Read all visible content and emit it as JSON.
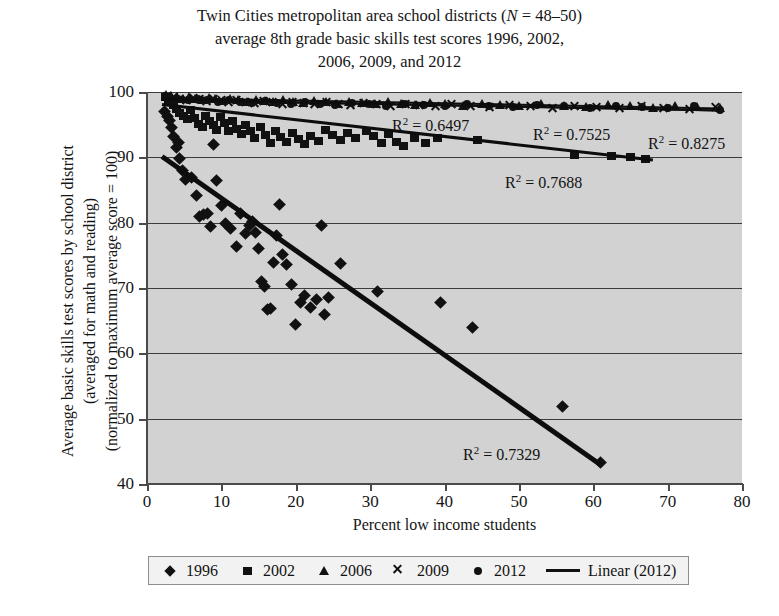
{
  "title": {
    "line1_pre": "Twin Cities metropolitan area school districts (",
    "line1_italic": "N",
    "line1_post": " = 48–50)",
    "line2": "average 8th grade basic skills test scores 1996, 2002,",
    "line3": "2006, 2009, and 2012"
  },
  "legend": {
    "items": [
      {
        "label": "1996",
        "marker": "diamond-marker"
      },
      {
        "label": "2002",
        "marker": "square-marker"
      },
      {
        "label": "2006",
        "marker": "triangle-marker"
      },
      {
        "label": "2009",
        "marker": "x-marker"
      },
      {
        "label": "2012",
        "marker": "circle-marker"
      },
      {
        "label": "Linear (2012)",
        "marker": "line-marker"
      }
    ]
  },
  "annotations": [
    {
      "text": "R² = 0.6497",
      "x": 392,
      "y": 115
    },
    {
      "text": "R² = 0.7525",
      "x": 533,
      "y": 124
    },
    {
      "text": "R² = 0.8275",
      "x": 648,
      "y": 133
    },
    {
      "text": "R² = 0.7688",
      "x": 505,
      "y": 172
    },
    {
      "text": "R² = 0.7329",
      "x": 463,
      "y": 444
    }
  ],
  "colors": {
    "plot_background": "#d2d2d2",
    "marker": "#111111",
    "gridline": "#3c3c3c",
    "axis": "#4a4a4a",
    "legend_background": "#f2f2f2"
  },
  "chart_data": {
    "type": "scatter",
    "title": "Twin Cities metropolitan area school districts (N = 48–50) average 8th grade basic skills test scores 1996, 2002, 2006, 2009, and 2012",
    "xlabel": "Percent low income students",
    "ylabel": "Average basic skills test scores by school district (averaged for math and reading) (normalized to maximum average score = 100)",
    "xlim": [
      0,
      80
    ],
    "ylim": [
      40,
      100
    ],
    "xticks": [
      0,
      10,
      20,
      30,
      40,
      50,
      60,
      70,
      80
    ],
    "yticks": [
      40,
      50,
      60,
      70,
      80,
      90,
      100
    ],
    "grid": "horizontal",
    "legend_position": "bottom",
    "series": [
      {
        "name": "1996",
        "marker": "diamond",
        "r_squared": 0.7329,
        "trendline": {
          "x0": 2.0,
          "y0": 90.5,
          "x1": 61.0,
          "y1": 43.3
        },
        "points": [
          [
            2.4,
            97.0
          ],
          [
            2.7,
            96.2
          ],
          [
            3.0,
            95.6
          ],
          [
            3.3,
            94.5
          ],
          [
            3.6,
            93.2
          ],
          [
            4.0,
            91.5
          ],
          [
            4.4,
            89.8
          ],
          [
            4.8,
            88.0
          ],
          [
            5.2,
            86.6
          ],
          [
            4.2,
            92.3
          ],
          [
            6.0,
            86.9
          ],
          [
            6.6,
            84.1
          ],
          [
            7.0,
            81.0
          ],
          [
            7.6,
            81.2
          ],
          [
            8.2,
            81.4
          ],
          [
            8.6,
            79.4
          ],
          [
            9.0,
            92.0
          ],
          [
            9.4,
            86.5
          ],
          [
            10.0,
            82.7
          ],
          [
            10.6,
            79.9
          ],
          [
            11.2,
            79.1
          ],
          [
            12.0,
            76.3
          ],
          [
            12.6,
            81.4
          ],
          [
            13.2,
            78.4
          ],
          [
            13.8,
            79.6
          ],
          [
            14.2,
            80.2
          ],
          [
            14.6,
            78.5
          ],
          [
            15.0,
            76.0
          ],
          [
            15.4,
            71.0
          ],
          [
            15.8,
            70.2
          ],
          [
            16.2,
            66.7
          ],
          [
            16.6,
            66.8
          ],
          [
            17.0,
            73.9
          ],
          [
            17.4,
            78.1
          ],
          [
            17.8,
            82.8
          ],
          [
            18.2,
            75.2
          ],
          [
            18.8,
            73.6
          ],
          [
            19.4,
            70.6
          ],
          [
            20.0,
            64.4
          ],
          [
            20.6,
            67.8
          ],
          [
            21.2,
            68.9
          ],
          [
            22.0,
            67.0
          ],
          [
            22.8,
            68.2
          ],
          [
            23.4,
            79.5
          ],
          [
            23.8,
            66.0
          ],
          [
            24.4,
            68.5
          ],
          [
            26.0,
            73.8
          ],
          [
            31.0,
            69.4
          ],
          [
            39.5,
            67.8
          ],
          [
            43.8,
            63.9
          ],
          [
            55.8,
            51.8
          ],
          [
            61.0,
            43.3
          ]
        ]
      },
      {
        "name": "2002",
        "marker": "square",
        "r_squared": 0.7688,
        "trendline": {
          "x0": 2.0,
          "y0": 98.3,
          "x1": 68.0,
          "y1": 89.8
        },
        "points": [
          [
            2.5,
            99.2
          ],
          [
            2.9,
            98.8
          ],
          [
            3.2,
            98.4
          ],
          [
            3.6,
            98.0
          ],
          [
            4.0,
            97.4
          ],
          [
            4.4,
            96.8
          ],
          [
            4.9,
            96.3
          ],
          [
            5.4,
            95.8
          ],
          [
            5.9,
            97.2
          ],
          [
            6.4,
            96.0
          ],
          [
            6.9,
            95.1
          ],
          [
            7.4,
            94.6
          ],
          [
            7.9,
            96.4
          ],
          [
            8.4,
            95.5
          ],
          [
            8.9,
            94.9
          ],
          [
            9.4,
            94.2
          ],
          [
            9.9,
            96.1
          ],
          [
            10.4,
            95.3
          ],
          [
            10.9,
            94.0
          ],
          [
            11.5,
            95.6
          ],
          [
            12.1,
            94.4
          ],
          [
            12.7,
            93.6
          ],
          [
            13.3,
            95.0
          ],
          [
            13.9,
            94.1
          ],
          [
            14.5,
            93.0
          ],
          [
            15.2,
            94.6
          ],
          [
            15.9,
            93.4
          ],
          [
            16.6,
            92.2
          ],
          [
            17.3,
            94.0
          ],
          [
            18.0,
            93.1
          ],
          [
            18.8,
            92.4
          ],
          [
            19.6,
            93.7
          ],
          [
            20.4,
            92.8
          ],
          [
            21.2,
            92.0
          ],
          [
            22.0,
            93.2
          ],
          [
            23.0,
            92.5
          ],
          [
            24.0,
            94.2
          ],
          [
            25.0,
            93.4
          ],
          [
            26.0,
            92.6
          ],
          [
            27.0,
            93.8
          ],
          [
            28.0,
            93.0
          ],
          [
            29.5,
            94.0
          ],
          [
            30.5,
            93.2
          ],
          [
            31.5,
            92.2
          ],
          [
            32.5,
            93.6
          ],
          [
            33.5,
            92.4
          ],
          [
            34.5,
            91.8
          ],
          [
            36.0,
            93.0
          ],
          [
            37.5,
            92.2
          ],
          [
            39.0,
            93.0
          ],
          [
            44.5,
            92.6
          ],
          [
            57.5,
            90.4
          ],
          [
            62.5,
            90.2
          ],
          [
            65.0,
            90.0
          ],
          [
            67.0,
            89.8
          ]
        ]
      },
      {
        "name": "2006",
        "marker": "triangle",
        "r_squared": 0.6497,
        "trendline": {
          "x0": 2.0,
          "y0": 99.2,
          "x1": 77.0,
          "y1": 97.6
        },
        "points": [
          [
            2.5,
            99.6
          ],
          [
            3.2,
            99.4
          ],
          [
            4.0,
            99.2
          ],
          [
            4.8,
            99.0
          ],
          [
            5.6,
            99.3
          ],
          [
            6.5,
            99.0
          ],
          [
            7.4,
            98.8
          ],
          [
            8.3,
            99.1
          ],
          [
            9.2,
            98.9
          ],
          [
            10.2,
            98.6
          ],
          [
            11.2,
            99.0
          ],
          [
            12.3,
            98.7
          ],
          [
            13.4,
            98.5
          ],
          [
            14.6,
            98.8
          ],
          [
            15.8,
            98.6
          ],
          [
            17.0,
            98.4
          ],
          [
            18.3,
            98.7
          ],
          [
            19.6,
            98.5
          ],
          [
            21.0,
            98.3
          ],
          [
            22.5,
            98.6
          ],
          [
            24.0,
            98.4
          ],
          [
            25.6,
            98.2
          ],
          [
            27.2,
            98.5
          ],
          [
            28.9,
            98.3
          ],
          [
            30.6,
            98.1
          ],
          [
            32.4,
            98.4
          ],
          [
            34.2,
            98.2
          ],
          [
            36.1,
            98.0
          ],
          [
            38.0,
            98.3
          ],
          [
            40.0,
            98.1
          ],
          [
            42.5,
            97.9
          ],
          [
            45.0,
            98.2
          ],
          [
            47.5,
            98.0
          ],
          [
            50.0,
            97.8
          ],
          [
            53.0,
            98.1
          ],
          [
            56.0,
            97.9
          ],
          [
            59.0,
            97.7
          ],
          [
            62.0,
            98.0
          ],
          [
            65.0,
            97.8
          ],
          [
            68.0,
            97.6
          ],
          [
            71.0,
            97.9
          ],
          [
            74.0,
            97.7
          ],
          [
            77.0,
            97.6
          ]
        ]
      },
      {
        "name": "2009",
        "marker": "x",
        "r_squared": 0.7525,
        "trendline": {
          "x0": 2.0,
          "y0": 99.0,
          "x1": 77.0,
          "y1": 97.4
        },
        "points": [
          [
            2.8,
            99.4
          ],
          [
            3.6,
            99.2
          ],
          [
            4.4,
            99.0
          ],
          [
            5.3,
            98.8
          ],
          [
            6.2,
            99.1
          ],
          [
            7.1,
            98.9
          ],
          [
            8.0,
            98.6
          ],
          [
            9.0,
            98.9
          ],
          [
            10.0,
            98.7
          ],
          [
            11.0,
            98.4
          ],
          [
            12.1,
            98.8
          ],
          [
            13.2,
            98.5
          ],
          [
            14.4,
            98.3
          ],
          [
            15.6,
            98.6
          ],
          [
            16.9,
            98.4
          ],
          [
            18.2,
            98.2
          ],
          [
            19.6,
            98.5
          ],
          [
            21.0,
            98.3
          ],
          [
            22.5,
            98.1
          ],
          [
            24.1,
            98.4
          ],
          [
            25.7,
            98.2
          ],
          [
            27.4,
            98.0
          ],
          [
            29.1,
            98.3
          ],
          [
            30.9,
            98.1
          ],
          [
            32.8,
            97.9
          ],
          [
            34.7,
            98.2
          ],
          [
            36.7,
            98.0
          ],
          [
            38.8,
            97.8
          ],
          [
            41.0,
            98.1
          ],
          [
            43.5,
            97.9
          ],
          [
            46.0,
            97.7
          ],
          [
            48.8,
            98.0
          ],
          [
            51.6,
            97.8
          ],
          [
            54.5,
            97.6
          ],
          [
            57.5,
            97.9
          ],
          [
            60.5,
            97.7
          ],
          [
            63.5,
            97.5
          ],
          [
            66.5,
            97.8
          ],
          [
            69.5,
            97.6
          ],
          [
            73.0,
            97.4
          ],
          [
            76.5,
            97.7
          ]
        ]
      },
      {
        "name": "2012",
        "marker": "circle",
        "r_squared": 0.8275,
        "trendline": {
          "x0": 2.0,
          "y0": 98.9,
          "x1": 77.0,
          "y1": 97.3
        },
        "points": [
          [
            3.0,
            99.3
          ],
          [
            4.2,
            99.0
          ],
          [
            5.5,
            98.8
          ],
          [
            6.8,
            99.0
          ],
          [
            8.1,
            98.7
          ],
          [
            9.5,
            98.5
          ],
          [
            11.0,
            98.8
          ],
          [
            12.5,
            98.5
          ],
          [
            14.1,
            98.3
          ],
          [
            15.8,
            98.6
          ],
          [
            17.5,
            98.3
          ],
          [
            19.3,
            98.1
          ],
          [
            21.2,
            98.4
          ],
          [
            23.2,
            98.2
          ],
          [
            25.3,
            98.0
          ],
          [
            27.5,
            98.3
          ],
          [
            29.8,
            98.1
          ],
          [
            32.2,
            97.9
          ],
          [
            34.7,
            98.2
          ],
          [
            37.3,
            98.0
          ],
          [
            40.0,
            97.8
          ],
          [
            43.0,
            98.1
          ],
          [
            46.0,
            97.9
          ],
          [
            49.2,
            97.7
          ],
          [
            52.5,
            98.0
          ],
          [
            56.0,
            97.8
          ],
          [
            59.5,
            97.6
          ],
          [
            63.0,
            97.9
          ],
          [
            66.5,
            97.7
          ],
          [
            70.0,
            97.5
          ],
          [
            73.5,
            97.8
          ],
          [
            77.0,
            97.3
          ]
        ]
      }
    ]
  }
}
